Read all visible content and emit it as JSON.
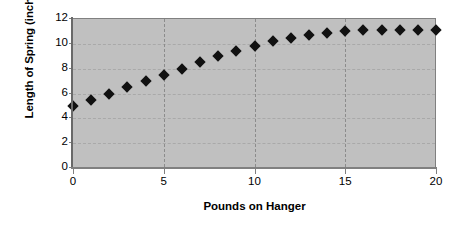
{
  "chart_data": {
    "type": "scatter",
    "title": "",
    "xlabel": "Pounds on Hanger",
    "ylabel": "Length of Spring (inches)",
    "xlim": [
      0,
      20
    ],
    "ylim": [
      0,
      12
    ],
    "xticks": [
      0,
      5,
      10,
      15,
      20
    ],
    "yticks": [
      0,
      2,
      4,
      6,
      8,
      10,
      12
    ],
    "xtick_labels": [
      "0",
      "5",
      "10",
      "15",
      "20"
    ],
    "ytick_labels": [
      "0",
      "2",
      "4",
      "6",
      "8",
      "10",
      "12"
    ],
    "grid": "dashed gray horizontal and vertical gridlines at major ticks",
    "legend": "none",
    "marker": "black filled diamond",
    "plot_background_color": "#c0c0c0",
    "figure_background_color": "#ffffff",
    "marker_color": "#111111",
    "gridline_color": "#a9a9a9",
    "axis_color": "#808080",
    "x": [
      0,
      1,
      2,
      3,
      4,
      5,
      6,
      7,
      8,
      9,
      10,
      11,
      12,
      13,
      14,
      15,
      16,
      17,
      18,
      19,
      20
    ],
    "y": [
      5.0,
      5.5,
      6.0,
      6.5,
      7.0,
      7.5,
      8.0,
      8.5,
      9.0,
      9.4,
      9.8,
      10.2,
      10.5,
      10.7,
      10.9,
      11.0,
      11.1,
      11.1,
      11.1,
      11.1,
      11.1
    ],
    "points": [
      {
        "x": 0,
        "y": 5.0
      },
      {
        "x": 1,
        "y": 5.5
      },
      {
        "x": 2,
        "y": 6.0
      },
      {
        "x": 3,
        "y": 6.5
      },
      {
        "x": 4,
        "y": 7.0
      },
      {
        "x": 5,
        "y": 7.5
      },
      {
        "x": 6,
        "y": 8.0
      },
      {
        "x": 7,
        "y": 8.5
      },
      {
        "x": 8,
        "y": 9.0
      },
      {
        "x": 9,
        "y": 9.4
      },
      {
        "x": 10,
        "y": 9.8
      },
      {
        "x": 11,
        "y": 10.2
      },
      {
        "x": 12,
        "y": 10.5
      },
      {
        "x": 13,
        "y": 10.7
      },
      {
        "x": 14,
        "y": 10.9
      },
      {
        "x": 15,
        "y": 11.0
      },
      {
        "x": 16,
        "y": 11.1
      },
      {
        "x": 17,
        "y": 11.1
      },
      {
        "x": 18,
        "y": 11.1
      },
      {
        "x": 19,
        "y": 11.1
      },
      {
        "x": 20,
        "y": 11.1
      }
    ]
  }
}
